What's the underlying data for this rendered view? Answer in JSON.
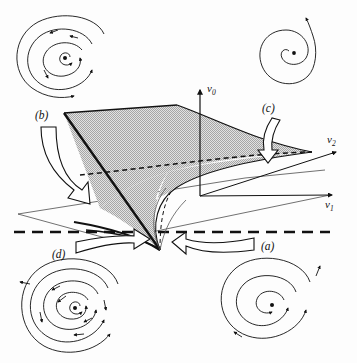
{
  "figure": {
    "background_color": "#fdfdfd",
    "ink_color": "#111111",
    "surface_fill": "#c9c9c9",
    "surface_stipple": "#9a9a9a"
  },
  "axes": {
    "vertical": {
      "name": "v0",
      "base": "v",
      "sub": "0"
    },
    "right_upper": {
      "name": "v2",
      "base": "v",
      "sub": "2"
    },
    "right_lower": {
      "name": "v1",
      "base": "v",
      "sub": "1"
    }
  },
  "callouts": [
    {
      "id": "a",
      "label": "(a)",
      "arrow": "hollow-arrow-left",
      "points_to": "region-a",
      "x": 268,
      "y": 247
    },
    {
      "id": "b",
      "label": "(b)",
      "arrow": "hollow-arrow-down-right",
      "points_to": "region-b",
      "x": 45,
      "y": 120
    },
    {
      "id": "c",
      "label": "(c)",
      "arrow": "hollow-arrow-down",
      "points_to": "region-c",
      "x": 268,
      "y": 107
    },
    {
      "id": "d",
      "label": "(d)",
      "arrow": "hollow-arrow-right",
      "points_to": "region-d",
      "x": 58,
      "y": 251
    }
  ],
  "phase_portraits": [
    {
      "id": "portrait-b",
      "corner": "top-left",
      "center_marker": "fixed-point-dot",
      "description": "unstable focus with surrounding stable limit cycle",
      "cx": 65,
      "cy": 58,
      "spiral_turns": 2.6,
      "arrow_count": 7
    },
    {
      "id": "portrait-c",
      "corner": "top-right",
      "center_marker": "fixed-point-dot",
      "description": "unstable focus spiralling outward",
      "cx": 294,
      "cy": 53,
      "spiral_turns": 1.7,
      "arrow_count": 1
    },
    {
      "id": "portrait-d",
      "corner": "bottom-left",
      "center_marker": "fixed-point-dot",
      "description": "unstable focus with two limit cycles, dense trajectories",
      "cx": 75,
      "cy": 308,
      "spiral_turns": 3.2,
      "arrow_count": 12
    },
    {
      "id": "portrait-a",
      "corner": "bottom-right",
      "center_marker": "fixed-point-dot",
      "description": "stable focus spiralling inward",
      "cx": 272,
      "cy": 305,
      "spiral_turns": 2.1,
      "arrow_count": 4
    }
  ],
  "surface": {
    "name": "folded bifurcation sheet",
    "fold_curve": "dashed",
    "cusp_point_label": "",
    "base_plane": "thin parallelogram outline",
    "bold_dashed_line": "v1 = 0 reference line"
  }
}
